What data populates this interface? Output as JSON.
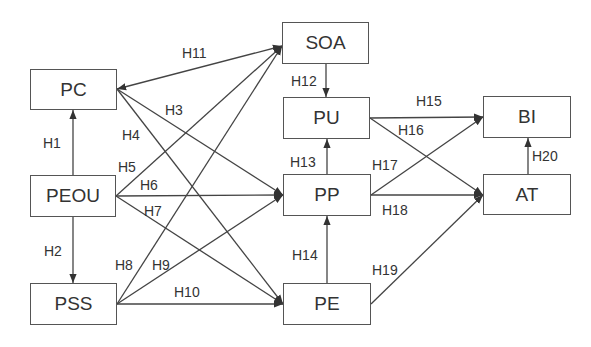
{
  "nodes": [
    {
      "id": "PC",
      "label": "PC",
      "x": 30,
      "y": 69,
      "w": 87,
      "h": 41
    },
    {
      "id": "PEOU",
      "label": "PEOU",
      "x": 30,
      "y": 175,
      "w": 86,
      "h": 42
    },
    {
      "id": "PSS",
      "label": "PSS",
      "x": 30,
      "y": 283,
      "w": 87,
      "h": 42
    },
    {
      "id": "SOA",
      "label": "SOA",
      "x": 282,
      "y": 22,
      "w": 87,
      "h": 42
    },
    {
      "id": "PU",
      "label": "PU",
      "x": 283,
      "y": 97,
      "w": 87,
      "h": 42
    },
    {
      "id": "PP",
      "label": "PP",
      "x": 283,
      "y": 174,
      "w": 88,
      "h": 42
    },
    {
      "id": "PE",
      "label": "PE",
      "x": 283,
      "y": 283,
      "w": 88,
      "h": 42
    },
    {
      "id": "BI",
      "label": "BI",
      "x": 483,
      "y": 96,
      "w": 88,
      "h": 42
    },
    {
      "id": "AT",
      "label": "AT",
      "x": 483,
      "y": 174,
      "w": 88,
      "h": 41
    }
  ],
  "edges": [
    {
      "id": "H1",
      "label": "H1",
      "from": "PEOU",
      "to": "PC",
      "x1": 73,
      "y1": 175,
      "x2": 73,
      "y2": 110,
      "lx": 43,
      "ly": 136
    },
    {
      "id": "H2",
      "label": "H2",
      "from": "PEOU",
      "to": "PSS",
      "x1": 73,
      "y1": 217,
      "x2": 73,
      "y2": 283,
      "lx": 44,
      "ly": 244
    },
    {
      "id": "H11",
      "label": "H11",
      "from": "SOA",
      "to": "PC",
      "bidirectional": true,
      "x1": 282,
      "y1": 46,
      "x2": 117,
      "y2": 89,
      "lx": 182,
      "ly": 46
    },
    {
      "id": "H3",
      "label": "H3",
      "from": "PC",
      "to": "PP",
      "x1": 117,
      "y1": 89,
      "x2": 283,
      "y2": 195,
      "lx": 165,
      "ly": 103
    },
    {
      "id": "H4",
      "label": "H4",
      "from": "PC",
      "to": "PE",
      "x1": 117,
      "y1": 89,
      "x2": 283,
      "y2": 304,
      "lx": 122,
      "ly": 128
    },
    {
      "id": "H5",
      "label": "H5",
      "from": "PEOU",
      "to": "SOA",
      "x1": 116,
      "y1": 196,
      "x2": 282,
      "y2": 46,
      "lx": 118,
      "ly": 160
    },
    {
      "id": "H6",
      "label": "H6",
      "from": "PEOU",
      "to": "PP",
      "x1": 116,
      "y1": 196,
      "x2": 283,
      "y2": 195,
      "lx": 140,
      "ly": 178
    },
    {
      "id": "H7",
      "label": "H7",
      "from": "PEOU",
      "to": "PE",
      "x1": 116,
      "y1": 196,
      "x2": 283,
      "y2": 304,
      "lx": 144,
      "ly": 204
    },
    {
      "id": "H8",
      "label": "H8",
      "from": "PSS",
      "to": "SOA",
      "x1": 117,
      "y1": 304,
      "x2": 282,
      "y2": 46,
      "lx": 115,
      "ly": 258
    },
    {
      "id": "H9",
      "label": "H9",
      "from": "PSS",
      "to": "PP",
      "x1": 117,
      "y1": 304,
      "x2": 283,
      "y2": 195,
      "lx": 152,
      "ly": 258
    },
    {
      "id": "H10",
      "label": "H10",
      "from": "PSS",
      "to": "PE",
      "x1": 117,
      "y1": 304,
      "x2": 283,
      "y2": 304,
      "lx": 174,
      "ly": 285
    },
    {
      "id": "H12",
      "label": "H12",
      "from": "SOA",
      "to": "PU",
      "x1": 326,
      "y1": 64,
      "x2": 326,
      "y2": 97,
      "lx": 291,
      "ly": 74
    },
    {
      "id": "H13",
      "label": "H13",
      "from": "PP",
      "to": "PU",
      "x1": 327,
      "y1": 174,
      "x2": 327,
      "y2": 139,
      "lx": 290,
      "ly": 155
    },
    {
      "id": "H14",
      "label": "H14",
      "from": "PE",
      "to": "PP",
      "x1": 327,
      "y1": 283,
      "x2": 327,
      "y2": 216,
      "lx": 292,
      "ly": 248
    },
    {
      "id": "H15",
      "label": "H15",
      "from": "PU",
      "to": "BI",
      "x1": 370,
      "y1": 118,
      "x2": 483,
      "y2": 117,
      "lx": 416,
      "ly": 94
    },
    {
      "id": "H16",
      "label": "H16",
      "from": "PU",
      "to": "AT",
      "x1": 370,
      "y1": 118,
      "x2": 483,
      "y2": 195,
      "lx": 398,
      "ly": 123
    },
    {
      "id": "H17",
      "label": "H17",
      "from": "PP",
      "to": "BI",
      "x1": 371,
      "y1": 195,
      "x2": 483,
      "y2": 117,
      "lx": 372,
      "ly": 158
    },
    {
      "id": "H18",
      "label": "H18",
      "from": "PP",
      "to": "AT",
      "x1": 371,
      "y1": 195,
      "x2": 483,
      "y2": 195,
      "lx": 382,
      "ly": 203
    },
    {
      "id": "H19",
      "label": "H19",
      "from": "PE",
      "to": "AT",
      "x1": 371,
      "y1": 304,
      "x2": 483,
      "y2": 195,
      "lx": 372,
      "ly": 263
    },
    {
      "id": "H20",
      "label": "H20",
      "from": "AT",
      "to": "BI",
      "x1": 528,
      "y1": 174,
      "x2": 528,
      "y2": 138,
      "lx": 532,
      "ly": 149
    }
  ],
  "colors": {
    "line": "#444444",
    "border": "#555555",
    "text": "#333333",
    "background": "#ffffff"
  }
}
